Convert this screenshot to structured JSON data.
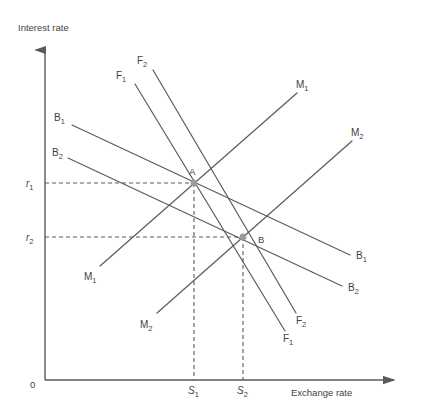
{
  "figure": {
    "title_y_axis": "Interest rate",
    "title_x_axis": "Exchange rate",
    "origin_label": "0"
  },
  "axes": {
    "y_ticks": [
      {
        "name": "r1",
        "base": "r",
        "sub": "1",
        "y": 183
      },
      {
        "name": "r2",
        "base": "r",
        "sub": "2",
        "y": 237
      }
    ],
    "x_ticks": [
      {
        "name": "S1",
        "base": "S",
        "sub": "1",
        "x": 194
      },
      {
        "name": "S2",
        "base": "S",
        "sub": "2",
        "x": 243
      }
    ]
  },
  "points": [
    {
      "id": "A",
      "label": "A",
      "x": 194,
      "y": 183,
      "label_x": 190,
      "label_y": 174
    },
    {
      "id": "B",
      "label": "B",
      "x": 243,
      "y": 237,
      "label_x": 257,
      "label_y": 242
    }
  ],
  "curves": [
    {
      "id": "B1",
      "base": "B",
      "sub": "1",
      "kind": "balance-of-payments",
      "x1": 72,
      "y1": 125,
      "x2": 350,
      "y2": 255,
      "label_start": {
        "x": 57,
        "y": 121
      },
      "label_end": {
        "x": 356,
        "y": 258
      }
    },
    {
      "id": "B2",
      "base": "B",
      "sub": "2",
      "kind": "balance-of-payments",
      "x1": 68,
      "y1": 158,
      "x2": 342,
      "y2": 286,
      "label_start": {
        "x": 54,
        "y": 155
      },
      "label_end": {
        "x": 348,
        "y": 290
      }
    },
    {
      "id": "F1",
      "base": "F",
      "sub": "1",
      "kind": "fiscal",
      "x1": 135,
      "y1": 84,
      "x2": 285,
      "y2": 331,
      "label_start": {
        "x": 119,
        "y": 78
      },
      "label_end": {
        "x": 285,
        "y": 341
      }
    },
    {
      "id": "F2",
      "base": "F",
      "sub": "2",
      "kind": "fiscal",
      "x1": 153,
      "y1": 70,
      "x2": 296,
      "y2": 313,
      "label_start": {
        "x": 138,
        "y": 64
      },
      "label_end": {
        "x": 297,
        "y": 323
      }
    },
    {
      "id": "M1",
      "base": "M",
      "sub": "1",
      "kind": "monetary",
      "x1": 100,
      "y1": 266,
      "x2": 297,
      "y2": 93,
      "label_start": {
        "x": 85,
        "y": 279
      },
      "label_end": {
        "x": 297,
        "y": 87
      }
    },
    {
      "id": "M2",
      "base": "M",
      "sub": "2",
      "kind": "monetary",
      "x1": 157,
      "y1": 313,
      "x2": 352,
      "y2": 141,
      "label_start": {
        "x": 141,
        "y": 327
      },
      "label_end": {
        "x": 352,
        "y": 135
      }
    }
  ],
  "geometry": {
    "origin": {
      "x": 45,
      "y": 380
    },
    "y_axis_top": 42,
    "x_axis_right": 401
  }
}
